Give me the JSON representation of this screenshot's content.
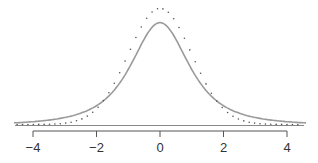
{
  "chart_data": {
    "type": "line",
    "title": "",
    "xlabel": "",
    "ylabel": "",
    "xlim": [
      -4.5,
      4.5
    ],
    "x_ticks": [
      -4,
      -2,
      0,
      2,
      4
    ],
    "x_tick_labels": [
      "−4",
      "−2",
      "0",
      "2",
      "4"
    ],
    "grid": false,
    "legend": null,
    "series": [
      {
        "name": "normal distribution",
        "style": "dotted",
        "color": "#555555",
        "peak_density": 0.399
      },
      {
        "name": "t-distribution (df=2)",
        "style": "solid",
        "color": "#9a9a9a",
        "peak_density": 0.354
      }
    ]
  },
  "colors": {
    "solid_curve": "#9a9a9a",
    "dotted_curve": "#555555",
    "axis": "#555555",
    "baseline": "#888888"
  }
}
